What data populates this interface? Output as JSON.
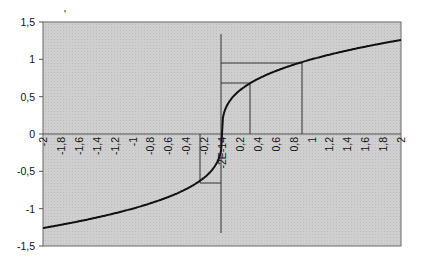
{
  "chart_data": {
    "type": "line",
    "title": "",
    "xlabel": "",
    "ylabel": "",
    "xlim": [
      -2,
      2
    ],
    "ylim": [
      -1.5,
      1.5
    ],
    "grid": false,
    "legend": null,
    "x_tick_labels": [
      "-2",
      "-1,8",
      "-1,6",
      "-1,4",
      "-1,2",
      "-1",
      "-0,8",
      "-0,6",
      "-0,4",
      "-0,2",
      "-2E-14",
      "0,2",
      "0,4",
      "0,6",
      "0,8",
      "1",
      "1,2",
      "1,4",
      "1,6",
      "1,8",
      "2"
    ],
    "y_tick_labels": [
      "1,5",
      "1",
      "0,5",
      "0",
      "-0,5",
      "-1",
      "-1,5"
    ],
    "series": [
      {
        "name": "y = x^(1/3)",
        "x": [
          -2,
          -1.8,
          -1.6,
          -1.4,
          -1.2,
          -1,
          -0.8,
          -0.6,
          -0.4,
          -0.2,
          0,
          0.2,
          0.4,
          0.6,
          0.8,
          1,
          1.2,
          1.4,
          1.6,
          1.8,
          2
        ],
        "y": [
          -1.26,
          -1.216,
          -1.17,
          -1.119,
          -1.063,
          -1,
          -0.928,
          -0.843,
          -0.737,
          -0.585,
          0,
          0.585,
          0.737,
          0.843,
          0.928,
          1,
          1.063,
          1.119,
          1.17,
          1.216,
          1.26
        ]
      }
    ],
    "annotations": [
      {
        "type": "guide",
        "x": 0.3,
        "y": 0.67
      },
      {
        "type": "guide",
        "x": 0.9,
        "y": 0.97
      },
      {
        "type": "guide",
        "x": -0.25,
        "y": -0.65
      }
    ]
  },
  "stray_mark": "'"
}
